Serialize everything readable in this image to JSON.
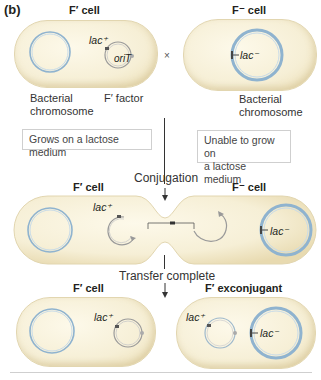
{
  "panel_label": "(b)",
  "top_row": {
    "left_cell": {
      "title": "F′ cell",
      "plasmid_gene": "lac⁺",
      "plasmid_origin": "oriT",
      "chromosome_caption_line1": "Bacterial",
      "chromosome_caption_line2": "chromosome",
      "plasmid_caption": "F′ factor",
      "phenotype": "Grows on a lactose medium"
    },
    "cross_symbol": "×",
    "right_cell": {
      "title": "F⁻ cell",
      "chromosome_gene": "lac⁻",
      "chromosome_caption_line1": "Bacterial",
      "chromosome_caption_line2": "chromosome",
      "phenotype_line1": "Unable to grow on",
      "phenotype_line2": "a lactose medium"
    }
  },
  "middle_row": {
    "stage_label": "Conjugation",
    "left_cell": {
      "title": "F′ cell",
      "plasmid_gene": "lac⁺"
    },
    "right_cell": {
      "title": "F⁻ cell",
      "chromosome_gene": "lac⁻"
    }
  },
  "bottom_row": {
    "stage_label": "Transfer complete",
    "left_cell": {
      "title": "F′ cell",
      "plasmid_gene": "lac⁺"
    },
    "right_cell": {
      "title": "F′ exconjugant",
      "plasmid_gene": "lac⁺",
      "chromosome_gene": "lac⁻"
    }
  },
  "colors": {
    "cell_fill": "#f6efd6",
    "chromosome_blue": "#8fb3cf",
    "plasmid_gray": "#9a9a9a",
    "text": "#231f20"
  }
}
